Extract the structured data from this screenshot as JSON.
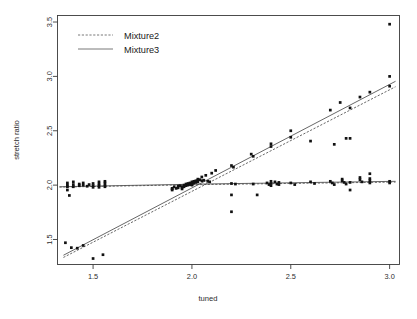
{
  "chart_data": {
    "type": "scatter",
    "title": "",
    "xlabel": "tuned",
    "ylabel": "stretch ratio",
    "xlim": [
      1.32,
      3.05
    ],
    "ylim": [
      1.27,
      3.56
    ],
    "xticks": [
      "1.5",
      "2.0",
      "2.5",
      "3.0"
    ],
    "xtick_values": [
      1.5,
      2.0,
      2.5,
      3.0
    ],
    "yticks": [
      "1.5",
      "2.0",
      "2.5",
      "3.0",
      "3.5"
    ],
    "ytick_values": [
      1.5,
      2.0,
      2.5,
      3.0,
      3.5
    ],
    "grid": false,
    "legend_position": "top-left",
    "legend": [
      {
        "label": "Mixture2",
        "style": "dashed"
      },
      {
        "label": "Mixture3",
        "style": "solid"
      }
    ],
    "series": [
      {
        "name": "Mixture2",
        "style": "dashed",
        "points_flat": [
          [
            1.37,
            2.02
          ],
          [
            1.37,
            2.0
          ],
          [
            1.37,
            1.985
          ],
          [
            1.37,
            1.955
          ],
          [
            1.38,
            1.905
          ],
          [
            1.4,
            2.03
          ],
          [
            1.4,
            2.005
          ],
          [
            1.4,
            1.985
          ],
          [
            1.43,
            2.01
          ],
          [
            1.43,
            1.995
          ],
          [
            1.45,
            2.02
          ],
          [
            1.45,
            2.0
          ],
          [
            1.47,
            1.99
          ],
          [
            1.48,
            2.005
          ],
          [
            1.5,
            2.015
          ],
          [
            1.5,
            1.995
          ],
          [
            1.5,
            1.98
          ],
          [
            1.53,
            2.03
          ],
          [
            1.53,
            2.01
          ],
          [
            1.53,
            1.995
          ],
          [
            1.53,
            1.98
          ],
          [
            1.56,
            2.035
          ],
          [
            1.56,
            2.02
          ],
          [
            1.56,
            2.0
          ],
          [
            1.56,
            1.985
          ],
          [
            1.9,
            1.97
          ],
          [
            1.9,
            1.955
          ],
          [
            1.91,
            1.985
          ],
          [
            1.92,
            1.97
          ],
          [
            1.93,
            1.99
          ],
          [
            1.93,
            1.975
          ],
          [
            1.94,
            1.995
          ],
          [
            1.95,
            1.98
          ],
          [
            1.95,
            1.965
          ],
          [
            1.96,
            2.0
          ],
          [
            1.96,
            1.985
          ],
          [
            1.97,
            2.01
          ],
          [
            1.97,
            1.995
          ],
          [
            1.98,
            2.015
          ],
          [
            1.98,
            2.0
          ],
          [
            1.99,
            2.02
          ],
          [
            1.99,
            2.005
          ],
          [
            2.0,
            2.03
          ],
          [
            2.0,
            2.015
          ],
          [
            2.0,
            2.0
          ],
          [
            2.01,
            2.035
          ],
          [
            2.01,
            2.02
          ],
          [
            2.02,
            2.04
          ],
          [
            2.02,
            2.025
          ],
          [
            2.03,
            2.045
          ],
          [
            2.03,
            2.03
          ],
          [
            2.04,
            2.05
          ],
          [
            2.05,
            2.04
          ],
          [
            2.06,
            2.045
          ],
          [
            2.08,
            2.035
          ],
          [
            2.09,
            2.03
          ],
          [
            2.2,
            2.015
          ],
          [
            2.2,
            1.91
          ],
          [
            2.22,
            2.01
          ],
          [
            2.31,
            2.01
          ],
          [
            2.33,
            1.91
          ],
          [
            2.38,
            2.02
          ],
          [
            2.39,
            2.005
          ],
          [
            2.4,
            2.035
          ],
          [
            2.4,
            2.015
          ],
          [
            2.4,
            1.995
          ],
          [
            2.42,
            2.03
          ],
          [
            2.43,
            2.01
          ],
          [
            2.44,
            2.025
          ],
          [
            2.44,
            2.005
          ],
          [
            2.5,
            2.02
          ],
          [
            2.52,
            2.005
          ],
          [
            2.6,
            2.03
          ],
          [
            2.62,
            2.015
          ],
          [
            2.7,
            2.035
          ],
          [
            2.71,
            2.02
          ],
          [
            2.72,
            2.005
          ],
          [
            2.76,
            2.055
          ],
          [
            2.76,
            2.04
          ],
          [
            2.77,
            2.025
          ],
          [
            2.78,
            2.01
          ],
          [
            2.8,
            2.025
          ],
          [
            2.8,
            1.955
          ],
          [
            2.85,
            2.07
          ],
          [
            2.85,
            2.05
          ],
          [
            2.86,
            2.03
          ],
          [
            2.9,
            2.06
          ],
          [
            2.9,
            2.04
          ],
          [
            2.9,
            2.02
          ],
          [
            3.0,
            2.035
          ],
          [
            3.0,
            2.02
          ]
        ],
        "points_rising": [
          [
            1.36,
            1.47
          ],
          [
            1.39,
            1.425
          ],
          [
            1.42,
            1.42
          ],
          [
            1.45,
            1.445
          ],
          [
            1.5,
            1.325
          ],
          [
            1.55,
            1.36
          ],
          [
            2.2,
            1.755
          ]
        ],
        "fit_flat": [
          [
            1.33,
            1.982
          ],
          [
            2.05,
            2.005
          ],
          [
            3.03,
            2.028
          ]
        ],
        "fit_rising": [
          [
            1.35,
            1.335
          ],
          [
            3.03,
            2.905
          ]
        ]
      },
      {
        "name": "Mixture3",
        "style": "solid",
        "points_rising": [
          [
            1.9,
            1.965
          ],
          [
            1.95,
            1.985
          ],
          [
            2.0,
            2.005
          ],
          [
            2.03,
            2.055
          ],
          [
            2.05,
            2.075
          ],
          [
            2.07,
            2.09
          ],
          [
            2.1,
            2.11
          ],
          [
            2.12,
            2.135
          ],
          [
            2.2,
            2.18
          ],
          [
            2.21,
            2.165
          ],
          [
            2.3,
            2.285
          ],
          [
            2.31,
            2.265
          ],
          [
            2.4,
            2.38
          ],
          [
            2.4,
            2.355
          ],
          [
            2.5,
            2.5
          ],
          [
            2.5,
            2.44
          ],
          [
            2.6,
            2.405
          ],
          [
            2.7,
            2.69
          ],
          [
            2.72,
            2.375
          ],
          [
            2.75,
            2.76
          ],
          [
            2.78,
            2.43
          ],
          [
            2.8,
            2.71
          ],
          [
            2.8,
            2.43
          ],
          [
            2.85,
            2.81
          ],
          [
            2.9,
            2.855
          ],
          [
            2.9,
            2.105
          ],
          [
            3.0,
            3.0
          ],
          [
            3.0,
            2.91
          ],
          [
            3.0,
            3.48
          ]
        ],
        "fit_flat": [
          [
            1.33,
            1.985
          ],
          [
            2.05,
            2.01
          ],
          [
            3.03,
            2.035
          ]
        ],
        "fit_rising": [
          [
            1.35,
            1.355
          ],
          [
            3.03,
            2.955
          ]
        ]
      }
    ],
    "outliers": [
      [
        3.0,
        3.48
      ]
    ],
    "colors": {
      "point": "#111111",
      "fit_line": "#4c4c4c",
      "axis": "#3a3a3a",
      "background": "#ffffff"
    }
  }
}
